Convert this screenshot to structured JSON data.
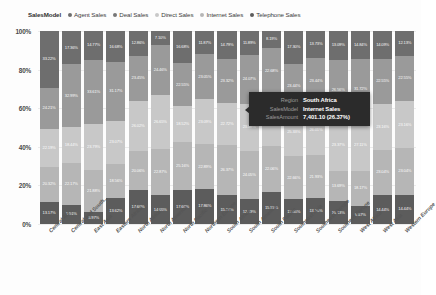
{
  "legend": {
    "title": "SalesModel",
    "items": [
      {
        "label": "Agent Sales",
        "color": "#6e6e6e"
      },
      {
        "label": "Deal Sales",
        "color": "#777777"
      },
      {
        "label": "Direct Sales",
        "color": "#c8c8c8"
      },
      {
        "label": "Internet Sales",
        "color": "#b6b6b6"
      },
      {
        "label": "Telephone Sales",
        "color": "#5c5c5c"
      }
    ]
  },
  "yaxis": {
    "ticks": [
      "100%",
      "80%",
      "60%",
      "40%",
      "20%",
      "0%"
    ]
  },
  "tooltip": {
    "rows": [
      {
        "key": "Region",
        "value": "South Africa"
      },
      {
        "key": "SalesModel",
        "value": "Internet Sales"
      },
      {
        "key": "SalesAmount",
        "value": "7,401.10 (26.37%)"
      }
    ]
  },
  "chart_data": {
    "type": "bar",
    "stacked": true,
    "normalized": true,
    "title": "",
    "xlabel": "",
    "ylabel": "",
    "ylim": [
      0,
      100
    ],
    "grid": true,
    "legend_position": "top",
    "categories": [
      "Central Afr...",
      "Central and South...",
      "East Asia",
      "Eastern Africa",
      "North Africa",
      "North America",
      "North Pacific",
      "Northern Europe",
      "South Africa",
      "South America",
      "South Pacific",
      "Southeast Asia",
      "Southeast Europe",
      "Southern Europe",
      "West Africa",
      "West Asia",
      "Western Europe"
    ],
    "series": [
      {
        "name": "Telephone Sales",
        "color": "#5c5c5c",
        "values": [
          13.17,
          9.91,
          5.97,
          13.62,
          17.6,
          14.05,
          17.66,
          17.86,
          15.27,
          12.19,
          15.53,
          13.05,
          13.05,
          10.13,
          9.67,
          14.44,
          14.44
        ],
        "labels": [
          "13.17%",
          "9.91%",
          "5.97%",
          "13.62%",
          "17.60%",
          "14.05%",
          "17.66%",
          "17.86%",
          "15.27%",
          "12.19%",
          "15.53%",
          "13.05%",
          "13.05%",
          "10.13%",
          "9.67%",
          "14.44%",
          "14.44%"
        ]
      },
      {
        "name": "Internet Sales",
        "color": "#b6b6b6",
        "values": [
          20.32,
          22.17,
          21.88,
          18.56,
          20.06,
          22.87,
          25.16,
          22.89,
          26.56,
          24.05,
          22.06,
          22.66,
          21.93,
          13.69,
          18.17,
          23.04,
          23.04
        ],
        "labels": [
          "20.32%",
          "22.17%",
          "21.88%",
          "18.56%",
          "20.06%",
          "22.87%",
          "25.16%",
          "22.89%",
          "26.37%",
          "24.05%",
          "22.06%",
          "22.66%",
          "21.93%",
          "13.69%",
          "18.17%",
          "23.04%",
          "23.04%"
        ]
      },
      {
        "name": "Direct Sales",
        "color": "#c8c8c8",
        "values": [
          22.19,
          18.44,
          23.79,
          23.07,
          26.02,
          26.65,
          18.52,
          23.09,
          22.72,
          23.09,
          25.02,
          25.33,
          26.01,
          23.37,
          27.11,
          23.16,
          23.16
        ],
        "labels": [
          "22.19%",
          "18.44%",
          "23.79%",
          "23.07%",
          "26.02%",
          "26.65%",
          "18.52%",
          "23.09%",
          "22.72%",
          "23.09%",
          "25.02%",
          "25.33%",
          "26.01%",
          "23.37%",
          "27.11%",
          "23.16%",
          "23.16%"
        ]
      },
      {
        "name": "Deal Sales",
        "color": "#9a9a9a",
        "values": [
          24.21,
          32.99,
          33.61,
          31.17,
          23.45,
          24.46,
          22.55,
          23.05,
          23.32,
          24.07,
          22.68,
          23.44,
          23.44,
          26.56,
          31.72,
          22.55,
          22.55
        ],
        "labels": [
          "24.21%",
          "32.99%",
          "33.61%",
          "31.17%",
          "23.45%",
          "24.46%",
          "22.55%",
          "23.05%",
          "23.32%",
          "24.07%",
          "22.68%",
          "23.44%",
          "23.44%",
          "26.56%",
          "31.72%",
          "22.55%",
          "22.55%"
        ]
      },
      {
        "name": "Agent Sales",
        "color": "#6e6e6e",
        "values": [
          33.22,
          17.36,
          14.77,
          16.68,
          12.86,
          7.1,
          16.68,
          11.87,
          14.79,
          11.89,
          8.19,
          17.3,
          13.73,
          13.09,
          14.84,
          14.09,
          12.13
        ],
        "labels": [
          "33.22%",
          "17.36%",
          "14.77%",
          "16.68%",
          "12.86%",
          "7.10%",
          "16.68%",
          "11.87%",
          "14.79%",
          "11.89%",
          "8.19%",
          "17.30%",
          "13.73%",
          "13.09%",
          "14.84%",
          "14.09%",
          "12.13%"
        ]
      }
    ]
  }
}
